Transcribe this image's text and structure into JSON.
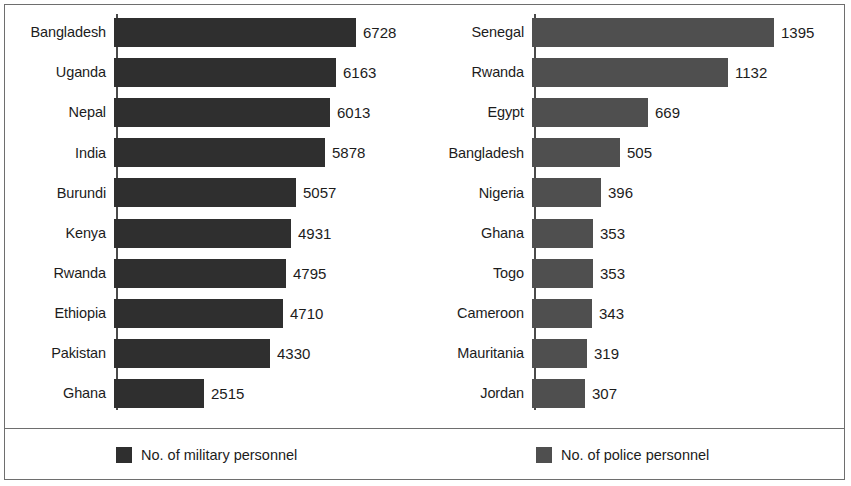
{
  "chart_data": [
    {
      "type": "bar",
      "orientation": "horizontal",
      "title": "",
      "xlabel": "",
      "ylabel": "",
      "series_name": "No. of military personnel",
      "color": "#2f2f2f",
      "xlim": [
        0,
        6728
      ],
      "grid": false,
      "categories": [
        "Bangladesh",
        "Uganda",
        "Nepal",
        "India",
        "Burundi",
        "Kenya",
        "Rwanda",
        "Ethiopia",
        "Pakistan",
        "Ghana"
      ],
      "values": [
        6728,
        6163,
        6013,
        5878,
        5057,
        4931,
        4795,
        4710,
        4330,
        2515
      ]
    },
    {
      "type": "bar",
      "orientation": "horizontal",
      "title": "",
      "xlabel": "",
      "ylabel": "",
      "series_name": "No. of police personnel",
      "color": "#4f4f4f",
      "xlim": [
        0,
        1395
      ],
      "grid": false,
      "categories": [
        "Senegal",
        "Rwanda",
        "Egypt",
        "Bangladesh",
        "Nigeria",
        "Ghana",
        "Togo",
        "Cameroon",
        "Mauritania",
        "Jordan"
      ],
      "values": [
        1395,
        1132,
        669,
        505,
        396,
        353,
        353,
        343,
        319,
        307
      ]
    }
  ],
  "panels": [
    {
      "id": "military",
      "rows": [
        {
          "label": "Bangladesh",
          "value": "6728"
        },
        {
          "label": "Uganda",
          "value": "6163"
        },
        {
          "label": "Nepal",
          "value": "6013"
        },
        {
          "label": "India",
          "value": "5878"
        },
        {
          "label": "Burundi",
          "value": "5057"
        },
        {
          "label": "Kenya",
          "value": "4931"
        },
        {
          "label": "Rwanda",
          "value": "4795"
        },
        {
          "label": "Ethiopia",
          "value": "4710"
        },
        {
          "label": "Pakistan",
          "value": "4330"
        },
        {
          "label": "Ghana",
          "value": "2515"
        }
      ]
    },
    {
      "id": "police",
      "rows": [
        {
          "label": "Senegal",
          "value": "1395"
        },
        {
          "label": "Rwanda",
          "value": "1132"
        },
        {
          "label": "Egypt",
          "value": "669"
        },
        {
          "label": "Bangladesh",
          "value": "505"
        },
        {
          "label": "Nigeria",
          "value": "396"
        },
        {
          "label": "Ghana",
          "value": "353"
        },
        {
          "label": "Togo",
          "value": "353"
        },
        {
          "label": "Cameroon",
          "value": "343"
        },
        {
          "label": "Mauritania",
          "value": "319"
        },
        {
          "label": "Jordan",
          "value": "307"
        }
      ]
    }
  ],
  "legend": {
    "items": [
      {
        "label": "No. of military personnel",
        "color": "#2f2f2f"
      },
      {
        "label": "No. of police personnel",
        "color": "#4f4f4f"
      }
    ]
  }
}
